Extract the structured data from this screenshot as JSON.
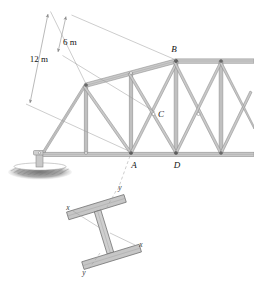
{
  "figure": {
    "line_color": "#8a8a8a",
    "member_fill": "#c9c9c9",
    "label_color": "#111111",
    "ground_color": "#6b6b6b",
    "flange_fill": "#c6c6c6"
  },
  "dimensions": [
    {
      "id": "dim-6m",
      "label": "6 m"
    },
    {
      "id": "dim-12m",
      "label": "12 m"
    }
  ],
  "joints": [
    {
      "id": "joint-A",
      "label": "A"
    },
    {
      "id": "joint-B",
      "label": "B"
    },
    {
      "id": "joint-C",
      "label": "C"
    },
    {
      "id": "joint-D",
      "label": "D"
    }
  ],
  "cross_section": {
    "shape": "I-beam",
    "axes": [
      {
        "id": "axis-y-top",
        "label": "y"
      },
      {
        "id": "axis-x-left",
        "label": "x"
      },
      {
        "id": "axis-x-right",
        "label": "x"
      },
      {
        "id": "axis-y-bottom",
        "label": "y"
      }
    ]
  },
  "support": {
    "type": "pin-on-ground",
    "label": ""
  }
}
